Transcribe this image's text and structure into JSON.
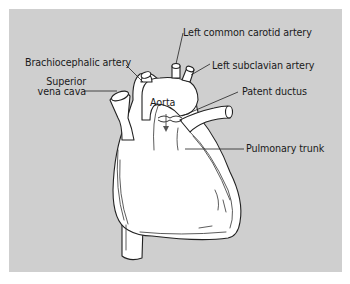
{
  "diagram": {
    "title": "",
    "background_color": "#cfcfcf",
    "heart_fill": "#ffffff",
    "outline_color": "#222222",
    "labels": {
      "left_common_carotid": "Left common carotid artery",
      "brachiocephalic": "Brachiocephalic artery",
      "left_subclavian": "Left subclavian artery",
      "superior_vena_cava_line1": "Superior",
      "superior_vena_cava_line2": "vena cava",
      "aorta": "Aorta",
      "patent_ductus": "Patent ductus",
      "pulmonary_trunk": "Pulmonary trunk"
    }
  }
}
